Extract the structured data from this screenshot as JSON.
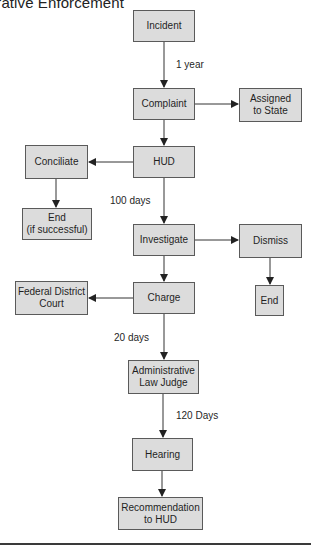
{
  "title": "Administrative Enforcement",
  "colors": {
    "box_fill": "#dcdcdc",
    "box_border": "#5a5a5a",
    "line": "#333333"
  },
  "nodes": {
    "incident": "Incident",
    "complaint": "Complaint",
    "assigned": "Assigned\nto State",
    "hud": "HUD",
    "conciliate": "Conciliate",
    "end_success": "End\n(if successful)",
    "investigate": "Investigate",
    "dismiss": "Dismiss",
    "end": "End",
    "charge": "Charge",
    "federal": "Federal District\nCourt",
    "alj": "Administrative\nLaw Judge",
    "hearing": "Hearing",
    "recommendation": "Recommendation\nto HUD"
  },
  "edge_labels": {
    "incident_complaint": "1 year",
    "hud_investigate": "100 days",
    "charge_alj": "20 days",
    "alj_hearing": "120 Days"
  },
  "edges": [
    {
      "from": "Incident",
      "to": "Complaint",
      "label": "1 year"
    },
    {
      "from": "Complaint",
      "to": "Assigned to State"
    },
    {
      "from": "Complaint",
      "to": "HUD"
    },
    {
      "from": "HUD",
      "to": "Conciliate"
    },
    {
      "from": "Conciliate",
      "to": "End (if successful)"
    },
    {
      "from": "HUD",
      "to": "Investigate",
      "label": "100 days"
    },
    {
      "from": "Investigate",
      "to": "Dismiss"
    },
    {
      "from": "Dismiss",
      "to": "End"
    },
    {
      "from": "Investigate",
      "to": "Charge"
    },
    {
      "from": "Charge",
      "to": "Federal District Court"
    },
    {
      "from": "Charge",
      "to": "Administrative Law Judge",
      "label": "20 days"
    },
    {
      "from": "Administrative Law Judge",
      "to": "Hearing",
      "label": "120 Days"
    },
    {
      "from": "Hearing",
      "to": "Recommendation to HUD"
    }
  ]
}
